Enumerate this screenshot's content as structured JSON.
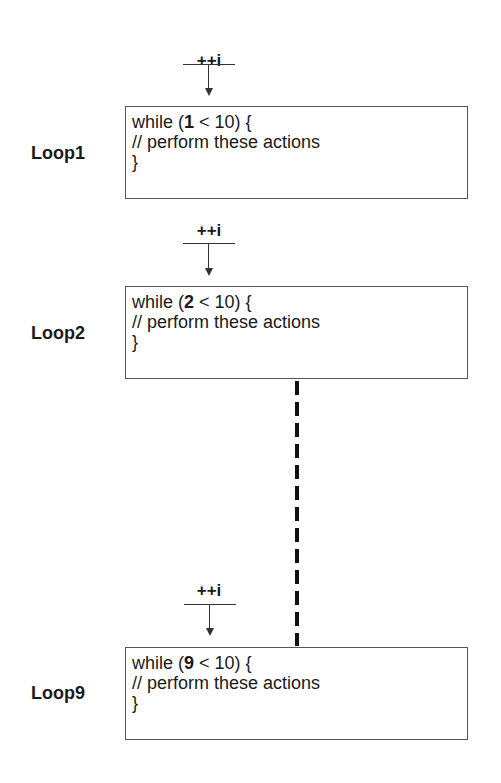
{
  "increment_label": "++i",
  "loops": [
    {
      "label": "Loop1",
      "line1_prefix": "while (",
      "counter": "1",
      "line1_suffix": " < 10) {",
      "line2": "// perform these actions",
      "line3": "}"
    },
    {
      "label": "Loop2",
      "line1_prefix": "while (",
      "counter": "2",
      "line1_suffix": " < 10) {",
      "line2": "// perform these actions",
      "line3": "}"
    },
    {
      "label": "Loop9",
      "line1_prefix": "while (",
      "counter": "9",
      "line1_suffix": " < 10) {",
      "line2": "// perform these actions",
      "line3": "}"
    }
  ]
}
